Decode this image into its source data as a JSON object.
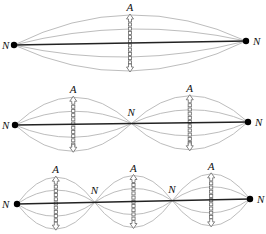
{
  "diagram": {
    "type": "standing-waves-harmonics",
    "colors": {
      "string": "#222222",
      "envelope": "#bdbdbd",
      "node": "#000000",
      "arrow": "#666666"
    },
    "panels": [
      {
        "id": "first-harmonic",
        "loops": 1,
        "node_labels": [
          "N",
          "N"
        ],
        "antinode_labels": [
          "A"
        ]
      },
      {
        "id": "second-harmonic",
        "loops": 2,
        "node_labels": [
          "N",
          "N",
          "N"
        ],
        "antinode_labels": [
          "A",
          "A"
        ]
      },
      {
        "id": "third-harmonic",
        "loops": 3,
        "node_labels": [
          "N",
          "N",
          "N",
          "N"
        ],
        "antinode_labels": [
          "A",
          "A",
          "A"
        ]
      }
    ],
    "labels": {
      "node": "N",
      "antinode": "A"
    }
  }
}
